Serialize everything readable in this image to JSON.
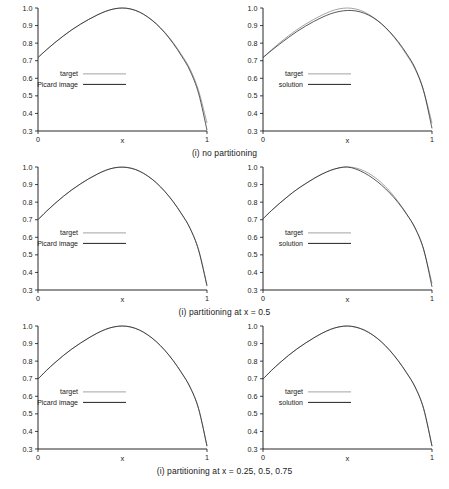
{
  "figure": {
    "axis": {
      "xlabel": "x",
      "xticks": [
        "0",
        "1"
      ],
      "yticks": [
        "0.3",
        "0.4",
        "0.5",
        "0.6",
        "0.7",
        "0.8",
        "0.9",
        "1.0"
      ],
      "xlim": [
        0,
        1
      ],
      "ylim": [
        0.3,
        1.0
      ]
    },
    "colors": {
      "target_line": "#999999",
      "result_line": "#222222",
      "axis": "#111111",
      "background": "#ffffff"
    },
    "captions": [
      "(i) no partitioning",
      "(i) partitioning at x = 0.5",
      "(i) partitioning at x = 0.25, 0.5, 0.75"
    ],
    "legend_left": {
      "target": "target",
      "series": "Picard image"
    },
    "legend_right": {
      "target": "target",
      "series": "solution"
    }
  },
  "chart_data": [
    {
      "id": "row1-left",
      "type": "line",
      "title": "",
      "xlabel": "x",
      "ylabel": "",
      "xlim": [
        0,
        1
      ],
      "ylim": [
        0.3,
        1.0
      ],
      "grid": false,
      "legend_position": "center-left",
      "caption": "(i) no partitioning",
      "x": [
        0,
        0.05,
        0.1,
        0.15,
        0.2,
        0.25,
        0.3,
        0.35,
        0.4,
        0.45,
        0.5,
        0.55,
        0.6,
        0.65,
        0.7,
        0.75,
        0.8,
        0.85,
        0.9,
        0.95,
        1.0
      ],
      "series": [
        {
          "name": "target",
          "values": [
            0.718,
            0.762,
            0.803,
            0.841,
            0.876,
            0.907,
            0.935,
            0.96,
            0.981,
            0.995,
            1.0,
            0.994,
            0.977,
            0.949,
            0.911,
            0.862,
            0.803,
            0.733,
            0.652,
            0.53,
            0.345
          ]
        },
        {
          "name": "Picard image",
          "values": [
            0.718,
            0.762,
            0.803,
            0.841,
            0.876,
            0.907,
            0.935,
            0.96,
            0.981,
            0.995,
            1.0,
            0.994,
            0.977,
            0.948,
            0.909,
            0.859,
            0.798,
            0.726,
            0.642,
            0.515,
            0.305
          ]
        }
      ]
    },
    {
      "id": "row1-right",
      "type": "line",
      "title": "",
      "xlabel": "x",
      "ylabel": "",
      "xlim": [
        0,
        1
      ],
      "ylim": [
        0.3,
        1.0
      ],
      "grid": false,
      "legend_position": "center-left",
      "caption": "(i) no partitioning",
      "x": [
        0,
        0.05,
        0.1,
        0.15,
        0.2,
        0.25,
        0.3,
        0.35,
        0.4,
        0.45,
        0.5,
        0.55,
        0.6,
        0.65,
        0.7,
        0.75,
        0.8,
        0.85,
        0.9,
        0.95,
        1.0
      ],
      "series": [
        {
          "name": "target",
          "values": [
            0.718,
            0.762,
            0.803,
            0.841,
            0.876,
            0.907,
            0.935,
            0.96,
            0.981,
            0.995,
            1.0,
            0.994,
            0.977,
            0.949,
            0.911,
            0.862,
            0.803,
            0.733,
            0.652,
            0.53,
            0.345
          ]
        },
        {
          "name": "solution",
          "values": [
            0.718,
            0.758,
            0.796,
            0.832,
            0.866,
            0.896,
            0.923,
            0.947,
            0.967,
            0.98,
            0.986,
            0.983,
            0.97,
            0.946,
            0.911,
            0.865,
            0.808,
            0.74,
            0.658,
            0.53,
            0.315
          ]
        }
      ]
    },
    {
      "id": "row2-left",
      "type": "line",
      "title": "",
      "xlabel": "x",
      "ylabel": "",
      "xlim": [
        0,
        1
      ],
      "ylim": [
        0.3,
        1.0
      ],
      "grid": false,
      "legend_position": "center-left",
      "caption": "(i) partitioning at x = 0.5",
      "x": [
        0,
        0.05,
        0.1,
        0.15,
        0.2,
        0.25,
        0.3,
        0.35,
        0.4,
        0.45,
        0.5,
        0.55,
        0.6,
        0.65,
        0.7,
        0.75,
        0.8,
        0.85,
        0.9,
        0.95,
        1.0
      ],
      "series": [
        {
          "name": "target",
          "values": [
            0.7,
            0.748,
            0.792,
            0.833,
            0.87,
            0.903,
            0.933,
            0.959,
            0.981,
            0.995,
            1.0,
            0.994,
            0.977,
            0.949,
            0.911,
            0.862,
            0.803,
            0.733,
            0.652,
            0.53,
            0.33
          ]
        },
        {
          "name": "Picard image",
          "values": [
            0.7,
            0.748,
            0.792,
            0.833,
            0.87,
            0.903,
            0.933,
            0.959,
            0.981,
            0.995,
            0.999,
            0.993,
            0.976,
            0.948,
            0.91,
            0.861,
            0.802,
            0.732,
            0.65,
            0.527,
            0.322
          ]
        }
      ]
    },
    {
      "id": "row2-right",
      "type": "line",
      "title": "",
      "xlabel": "x",
      "ylabel": "",
      "xlim": [
        0,
        1
      ],
      "ylim": [
        0.3,
        1.0
      ],
      "grid": false,
      "legend_position": "center-left",
      "caption": "(i) partitioning at x = 0.5",
      "x": [
        0,
        0.05,
        0.1,
        0.15,
        0.2,
        0.25,
        0.3,
        0.35,
        0.4,
        0.45,
        0.5,
        0.55,
        0.6,
        0.65,
        0.7,
        0.75,
        0.8,
        0.85,
        0.9,
        0.95,
        1.0
      ],
      "series": [
        {
          "name": "target",
          "values": [
            0.705,
            0.752,
            0.795,
            0.835,
            0.872,
            0.904,
            0.934,
            0.96,
            0.981,
            0.995,
            1.0,
            0.994,
            0.977,
            0.949,
            0.911,
            0.862,
            0.803,
            0.733,
            0.652,
            0.53,
            0.338
          ]
        },
        {
          "name": "solution",
          "values": [
            0.705,
            0.752,
            0.795,
            0.835,
            0.872,
            0.904,
            0.934,
            0.96,
            0.981,
            0.995,
            1.0,
            0.988,
            0.966,
            0.936,
            0.898,
            0.852,
            0.797,
            0.731,
            0.653,
            0.534,
            0.318
          ]
        }
      ]
    },
    {
      "id": "row3-left",
      "type": "line",
      "title": "",
      "xlabel": "x",
      "ylabel": "",
      "xlim": [
        0,
        1
      ],
      "ylim": [
        0.3,
        1.0
      ],
      "grid": false,
      "legend_position": "center-left",
      "caption": "(i) partitioning at x = 0.25, 0.5, 0.75",
      "x": [
        0,
        0.05,
        0.1,
        0.15,
        0.2,
        0.25,
        0.3,
        0.35,
        0.4,
        0.45,
        0.5,
        0.55,
        0.6,
        0.65,
        0.7,
        0.75,
        0.8,
        0.85,
        0.9,
        0.95,
        1.0
      ],
      "series": [
        {
          "name": "target",
          "values": [
            0.698,
            0.747,
            0.791,
            0.832,
            0.869,
            0.902,
            0.932,
            0.959,
            0.981,
            0.995,
            1.0,
            0.994,
            0.977,
            0.949,
            0.911,
            0.862,
            0.803,
            0.733,
            0.652,
            0.53,
            0.318
          ]
        },
        {
          "name": "Picard image",
          "values": [
            0.698,
            0.747,
            0.791,
            0.832,
            0.869,
            0.902,
            0.932,
            0.959,
            0.981,
            0.995,
            1.0,
            0.994,
            0.977,
            0.949,
            0.911,
            0.862,
            0.803,
            0.733,
            0.652,
            0.53,
            0.316
          ]
        }
      ]
    },
    {
      "id": "row3-right",
      "type": "line",
      "title": "",
      "xlabel": "x",
      "ylabel": "",
      "xlim": [
        0,
        1
      ],
      "ylim": [
        0.3,
        1.0
      ],
      "grid": false,
      "legend_position": "center-left",
      "caption": "(i) partitioning at x = 0.25, 0.5, 0.75",
      "x": [
        0,
        0.05,
        0.1,
        0.15,
        0.2,
        0.25,
        0.3,
        0.35,
        0.4,
        0.45,
        0.5,
        0.55,
        0.6,
        0.65,
        0.7,
        0.75,
        0.8,
        0.85,
        0.9,
        0.95,
        1.0
      ],
      "series": [
        {
          "name": "target",
          "values": [
            0.698,
            0.747,
            0.791,
            0.832,
            0.869,
            0.902,
            0.932,
            0.959,
            0.981,
            0.995,
            1.0,
            0.994,
            0.977,
            0.949,
            0.911,
            0.862,
            0.803,
            0.733,
            0.652,
            0.53,
            0.318
          ]
        },
        {
          "name": "solution",
          "values": [
            0.698,
            0.747,
            0.791,
            0.832,
            0.869,
            0.902,
            0.932,
            0.959,
            0.981,
            0.995,
            1.0,
            0.993,
            0.976,
            0.948,
            0.91,
            0.861,
            0.802,
            0.733,
            0.653,
            0.532,
            0.316
          ]
        }
      ]
    }
  ]
}
